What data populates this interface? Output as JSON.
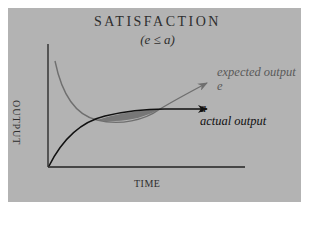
{
  "title": "SATISFACTION",
  "subtitle": "(e ≤ a)",
  "axes": {
    "x_label": "TIME",
    "y_label": "OUTPUT"
  },
  "curves": [
    {
      "name": "expected output",
      "symbol": "e",
      "color": "#6f6f6f",
      "shape": "decreasing then rising (U-shaped)"
    },
    {
      "name": "actual output",
      "symbol": "a",
      "color": "#111111",
      "shape": "concave increasing, leveling off"
    }
  ],
  "shaded_region": {
    "meaning": "actual output exceeds expected output",
    "color": "#777777"
  },
  "labels": {
    "expected": "expected output",
    "expected_symbol": "e",
    "actual_symbol": "a",
    "actual": "actual output"
  },
  "colors": {
    "panel": "#b3b3b3",
    "text": "#2e2e2e"
  }
}
